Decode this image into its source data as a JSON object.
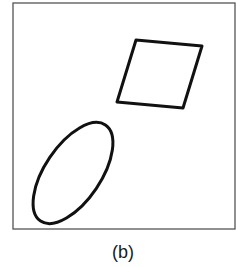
{
  "figure": {
    "caption": "(b)",
    "frame": {
      "x": 13,
      "y": 3,
      "width": 222,
      "height": 226,
      "stroke": "#555555",
      "stroke_width": 1.3
    },
    "shapes": [
      {
        "type": "quadrilateral",
        "points": "136,40 202,46 183,108 117,102",
        "stroke": "#111111",
        "stroke_width": 3
      },
      {
        "type": "ellipse",
        "cx": 73,
        "cy": 173,
        "rx": 58,
        "ry": 28,
        "rotation": -56,
        "stroke": "#111111",
        "stroke_width": 3
      }
    ]
  }
}
